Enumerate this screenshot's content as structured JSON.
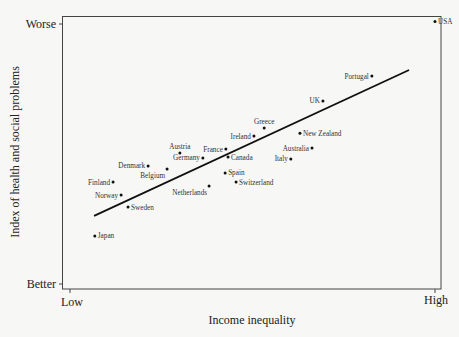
{
  "chart_data": {
    "type": "scatter",
    "title": "",
    "xlabel": "Income inequality",
    "ylabel": "Index of health and social problems",
    "xlim": [
      0,
      10
    ],
    "ylim": [
      0,
      10
    ],
    "x_tick_labels": [
      {
        "pos": 0,
        "label": "Low"
      },
      {
        "pos": 10,
        "label": "High"
      }
    ],
    "y_tick_labels": [
      {
        "pos": 0,
        "label": "Better"
      },
      {
        "pos": 10,
        "label": "Worse"
      }
    ],
    "grid": false,
    "legend": null,
    "points": [
      {
        "label": "USA",
        "x": 10.0,
        "y": 10.1,
        "anchor": "right"
      },
      {
        "label": "Portugal",
        "x": 8.27,
        "y": 8.0,
        "anchor": "left"
      },
      {
        "label": "UK",
        "x": 6.93,
        "y": 7.04,
        "anchor": "left"
      },
      {
        "label": "New Zealand",
        "x": 6.3,
        "y": 5.8,
        "anchor": "right"
      },
      {
        "label": "Greece",
        "x": 5.32,
        "y": 6.0,
        "anchor": "above"
      },
      {
        "label": "Ireland",
        "x": 5.04,
        "y": 5.69,
        "anchor": "left"
      },
      {
        "label": "Australia",
        "x": 6.63,
        "y": 5.23,
        "anchor": "left"
      },
      {
        "label": "Italy",
        "x": 6.05,
        "y": 4.81,
        "anchor": "left"
      },
      {
        "label": "France",
        "x": 4.27,
        "y": 5.19,
        "anchor": "left"
      },
      {
        "label": "Canada",
        "x": 4.33,
        "y": 4.88,
        "anchor": "right"
      },
      {
        "label": "Austria",
        "x": 3.01,
        "y": 5.04,
        "anchor": "above"
      },
      {
        "label": "Germany",
        "x": 3.64,
        "y": 4.85,
        "anchor": "left"
      },
      {
        "label": "Denmark",
        "x": 2.14,
        "y": 4.54,
        "anchor": "left"
      },
      {
        "label": "Belgium",
        "x": 2.66,
        "y": 4.42,
        "anchor": "below-left"
      },
      {
        "label": "Spain",
        "x": 4.25,
        "y": 4.27,
        "anchor": "right"
      },
      {
        "label": "Switzerland",
        "x": 4.55,
        "y": 3.92,
        "anchor": "right"
      },
      {
        "label": "Netherlands",
        "x": 3.81,
        "y": 3.77,
        "anchor": "below-left"
      },
      {
        "label": "Finland",
        "x": 1.18,
        "y": 3.92,
        "anchor": "left"
      },
      {
        "label": "Norway",
        "x": 1.4,
        "y": 3.42,
        "anchor": "left"
      },
      {
        "label": "Sweden",
        "x": 1.59,
        "y": 2.96,
        "anchor": "right"
      },
      {
        "label": "Japan",
        "x": 0.68,
        "y": 1.85,
        "anchor": "right"
      }
    ],
    "trendline": {
      "x": [
        0.66,
        9.29
      ],
      "y": [
        2.62,
        8.23
      ]
    }
  },
  "colors": {
    "background": "#f7f7f5",
    "axis": "#333333",
    "points": "#111111",
    "trendline": "#111111"
  }
}
